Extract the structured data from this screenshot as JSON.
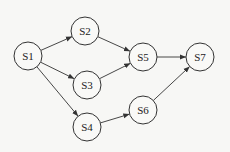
{
  "diagram": {
    "type": "directed-graph",
    "colors": {
      "stroke": "#333333",
      "background": "#f7f7f5",
      "text": "#222222"
    },
    "node_radius": 14,
    "nodes": [
      {
        "id": "S1",
        "label": "S1",
        "x": 28,
        "y": 56
      },
      {
        "id": "S2",
        "label": "S2",
        "x": 85,
        "y": 31
      },
      {
        "id": "S3",
        "label": "S3",
        "x": 87,
        "y": 85
      },
      {
        "id": "S4",
        "label": "S4",
        "x": 87,
        "y": 127
      },
      {
        "id": "S5",
        "label": "S5",
        "x": 143,
        "y": 57
      },
      {
        "id": "S6",
        "label": "S6",
        "x": 143,
        "y": 110
      },
      {
        "id": "S7",
        "label": "S7",
        "x": 200,
        "y": 57
      }
    ],
    "edges": [
      {
        "from": "S1",
        "to": "S2"
      },
      {
        "from": "S1",
        "to": "S3"
      },
      {
        "from": "S1",
        "to": "S4"
      },
      {
        "from": "S2",
        "to": "S5"
      },
      {
        "from": "S3",
        "to": "S5"
      },
      {
        "from": "S4",
        "to": "S6"
      },
      {
        "from": "S5",
        "to": "S7"
      },
      {
        "from": "S6",
        "to": "S7"
      }
    ]
  }
}
